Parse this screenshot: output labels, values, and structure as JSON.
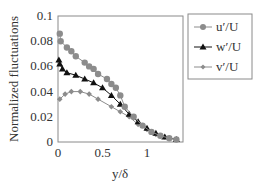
{
  "chart_data": {
    "type": "line",
    "title": "",
    "xlabel": "y/δ",
    "ylabel": "Normalized fluctuations",
    "xlim": [
      0,
      1.4
    ],
    "ylim": [
      0,
      0.1
    ],
    "xticks": [
      0,
      0.5,
      1
    ],
    "xtick_labels": [
      "0",
      "0.5",
      "1"
    ],
    "yticks": [
      0,
      0.02,
      0.04,
      0.06,
      0.08,
      0.1
    ],
    "ytick_labels": [
      "0",
      "0.02",
      "0.04",
      "0.06",
      "0.08",
      "0.1"
    ],
    "grid": false,
    "legend_position": "upper right, outside plot",
    "series": [
      {
        "name": "u′/U",
        "marker": "circle",
        "color": "#8c8c8c",
        "x": [
          0.02,
          0.03,
          0.1,
          0.15,
          0.2,
          0.3,
          0.35,
          0.4,
          0.45,
          0.55,
          0.6,
          0.65,
          0.7,
          0.75,
          0.85,
          0.95,
          1.05,
          1.15,
          1.25,
          1.33
        ],
        "y": [
          0.086,
          0.08,
          0.075,
          0.072,
          0.068,
          0.063,
          0.06,
          0.058,
          0.054,
          0.05,
          0.046,
          0.043,
          0.037,
          0.028,
          0.02,
          0.013,
          0.008,
          0.005,
          0.003,
          0.002
        ]
      },
      {
        "name": "w′/U",
        "marker": "triangle",
        "color": "#111111",
        "x": [
          0.01,
          0.02,
          0.05,
          0.1,
          0.2,
          0.3,
          0.4,
          0.5,
          0.6,
          0.7,
          0.8,
          0.9,
          1.0,
          1.1,
          1.2,
          1.33
        ],
        "y": [
          0.065,
          0.062,
          0.058,
          0.055,
          0.053,
          0.05,
          0.047,
          0.043,
          0.037,
          0.03,
          0.022,
          0.016,
          0.011,
          0.007,
          0.004,
          0.002
        ]
      },
      {
        "name": "v′/U",
        "marker": "diamond",
        "color": "#8c8c8c",
        "x": [
          0.02,
          0.08,
          0.15,
          0.25,
          0.35,
          0.45,
          0.6,
          0.7,
          0.8,
          0.9,
          1.0,
          1.1,
          1.2,
          1.33
        ],
        "y": [
          0.034,
          0.038,
          0.04,
          0.04,
          0.038,
          0.034,
          0.028,
          0.024,
          0.02,
          0.014,
          0.01,
          0.006,
          0.004,
          0.002
        ]
      }
    ]
  },
  "legend": {
    "items": [
      {
        "label": "u′/U"
      },
      {
        "label": "w′/U"
      },
      {
        "label": "v′/U"
      }
    ]
  }
}
